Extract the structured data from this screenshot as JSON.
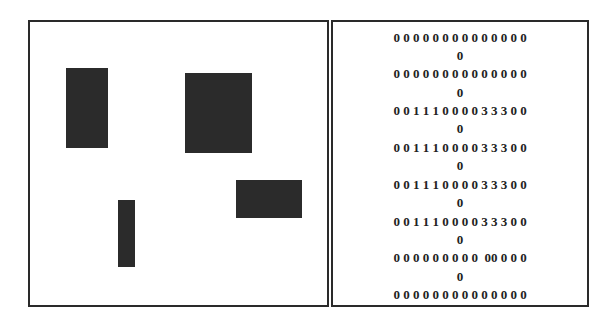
{
  "figure": {
    "left_panel": {
      "description": "binary image with four dark rectangular regions",
      "regions": [
        {
          "id": "region-1",
          "left": 38,
          "top": 48,
          "width": 42,
          "height": 80
        },
        {
          "id": "region-2",
          "left": 157,
          "top": 53,
          "width": 67,
          "height": 80
        },
        {
          "id": "region-3",
          "left": 208,
          "top": 160,
          "width": 66,
          "height": 38
        },
        {
          "id": "region-4",
          "left": 90,
          "top": 180,
          "width": 17,
          "height": 67
        }
      ],
      "fill_color": "#2b2b2b"
    },
    "right_panel": {
      "description": "label matrix",
      "rows": [
        {
          "main": "0 0 0 0 0 0 0 0 0 0 0 0 0 0",
          "wrap": "0"
        },
        {
          "main": "0 0 0 0 0 0 0 0 0 0 0 0 0 0",
          "wrap": "0"
        },
        {
          "main": "0 0 1 1 1 0 0 0 0 3 3 3 0 0",
          "wrap": "0"
        },
        {
          "main": "0 0 1 1 1 0 0 0 0 3 3 3 0 0",
          "wrap": "0"
        },
        {
          "main": "0 0 1 1 1 0 0 0 0 3 3 3 0 0",
          "wrap": "0"
        },
        {
          "main": "0 0 1 1 1 0 0 0 0 3 3 3 0 0",
          "wrap": "0"
        },
        {
          "main": "0 0 0 0 0 0 0 0 0  00 0 0 0",
          "wrap": "0"
        },
        {
          "main": "0 0 0 0 0 0 0 0 0 0 0 0 0 0",
          "wrap": ""
        }
      ]
    },
    "border_color": "#2a2a2a"
  }
}
